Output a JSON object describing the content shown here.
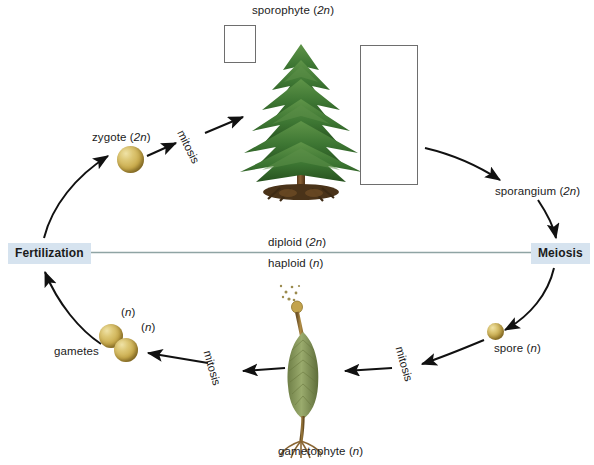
{
  "diagram": {
    "title_top": "sporophyte (2n)",
    "labels": {
      "sporophyte": {
        "text": "sporophyte (",
        "italic": "2n",
        "tail": ")"
      },
      "zygote": {
        "text": "zygote (",
        "italic": "2n",
        "tail": ")"
      },
      "sporangium": {
        "text": "sporangium (",
        "italic": "2n",
        "tail": ")"
      },
      "spore": {
        "text": "spore (",
        "italic": "n",
        "tail": ")"
      },
      "gametes": {
        "text": "gametes"
      },
      "gametophyte": {
        "text": "gametophyte (",
        "italic": "n",
        "tail": ")"
      },
      "diploid": {
        "text": "diploid (",
        "italic": "2n",
        "tail": ")"
      },
      "haploid": {
        "text": "haploid (",
        "italic": "n",
        "tail": ")"
      },
      "gamete_n_1": {
        "text": "(",
        "italic": "n",
        "tail": ")"
      },
      "gamete_n_2": {
        "text": "(",
        "italic": "n",
        "tail": ")"
      }
    },
    "key_stages": {
      "fertilization": "Fertilization",
      "meiosis": "Meiosis"
    },
    "process_labels": {
      "mitosis_zygote": "mitosis",
      "mitosis_gametophyte_left": "mitosis",
      "mitosis_spore": "mitosis"
    },
    "colors": {
      "key_stage_bg": "#d6e3ef",
      "divider_line": "#8fa4a4",
      "arrow": "#111111",
      "sphere_gold": "#c9ab4c",
      "tree_green": "#3f7a36",
      "trunk_brown": "#7a5630",
      "gametophyte_green": "#8a9a63",
      "inset_border": "#6e6e6e",
      "text": "#1b1b1b"
    }
  }
}
